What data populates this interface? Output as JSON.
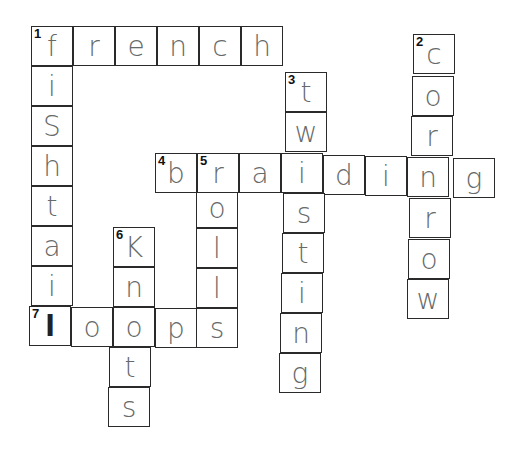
{
  "puzzle": {
    "cell_width": 42,
    "cell_height": 40,
    "cells": [
      {
        "x": 31,
        "y": 26,
        "letter": "f",
        "num": "1"
      },
      {
        "x": 73,
        "y": 26,
        "letter": "r"
      },
      {
        "x": 115,
        "y": 26,
        "letter": "e"
      },
      {
        "x": 157,
        "y": 26,
        "letter": "n"
      },
      {
        "x": 199,
        "y": 26,
        "letter": "c"
      },
      {
        "x": 241,
        "y": 26,
        "letter": "h"
      },
      {
        "x": 31,
        "y": 66,
        "letter": "i"
      },
      {
        "x": 31,
        "y": 106,
        "letter": "S"
      },
      {
        "x": 31,
        "y": 146,
        "letter": "h"
      },
      {
        "x": 31,
        "y": 186,
        "letter": "t"
      },
      {
        "x": 31,
        "y": 226,
        "letter": "a"
      },
      {
        "x": 31,
        "y": 266,
        "letter": "i"
      },
      {
        "x": 29,
        "y": 306,
        "letter": "l",
        "num": "7",
        "dark": true
      },
      {
        "x": 71,
        "y": 307,
        "letter": "o"
      },
      {
        "x": 113,
        "y": 307,
        "letter": "o"
      },
      {
        "x": 155,
        "y": 308,
        "letter": "p"
      },
      {
        "x": 196,
        "y": 308,
        "letter": "s"
      },
      {
        "x": 113,
        "y": 227,
        "letter": "K",
        "num": "6"
      },
      {
        "x": 113,
        "y": 267,
        "letter": "n"
      },
      {
        "x": 109,
        "y": 347,
        "letter": "t"
      },
      {
        "x": 108,
        "y": 387,
        "letter": "s"
      },
      {
        "x": 196,
        "y": 188,
        "letter": "o"
      },
      {
        "x": 196,
        "y": 228,
        "letter": "l"
      },
      {
        "x": 196,
        "y": 268,
        "letter": "l"
      },
      {
        "x": 155,
        "y": 153,
        "letter": "b",
        "num": "4"
      },
      {
        "x": 197,
        "y": 153,
        "letter": "r",
        "num": "5"
      },
      {
        "x": 239,
        "y": 153,
        "letter": "a"
      },
      {
        "x": 281,
        "y": 153,
        "letter": "i"
      },
      {
        "x": 323,
        "y": 155,
        "letter": "d"
      },
      {
        "x": 365,
        "y": 156,
        "letter": "i"
      },
      {
        "x": 407,
        "y": 157,
        "letter": "n"
      },
      {
        "x": 453,
        "y": 158,
        "letter": "g"
      },
      {
        "x": 285,
        "y": 72,
        "letter": "t",
        "num": "3"
      },
      {
        "x": 285,
        "y": 112,
        "letter": "w"
      },
      {
        "x": 283,
        "y": 193,
        "letter": "s"
      },
      {
        "x": 282,
        "y": 233,
        "letter": "t"
      },
      {
        "x": 281,
        "y": 273,
        "letter": "i"
      },
      {
        "x": 280,
        "y": 313,
        "letter": "n"
      },
      {
        "x": 279,
        "y": 353,
        "letter": "g"
      },
      {
        "x": 413,
        "y": 34,
        "letter": "c",
        "num": "2"
      },
      {
        "x": 412,
        "y": 76,
        "letter": "o"
      },
      {
        "x": 411,
        "y": 116,
        "letter": "r"
      },
      {
        "x": 409,
        "y": 198,
        "letter": "r"
      },
      {
        "x": 408,
        "y": 239,
        "letter": "o"
      },
      {
        "x": 407,
        "y": 279,
        "letter": "w"
      }
    ]
  },
  "words": {
    "across": [
      {
        "num": "1",
        "answer": "french"
      },
      {
        "num": "4",
        "answer": "braiding"
      },
      {
        "num": "7",
        "answer": "loops"
      }
    ],
    "down": [
      {
        "num": "1",
        "answer": "fishtail"
      },
      {
        "num": "2",
        "answer": "cornrow"
      },
      {
        "num": "3",
        "answer": "twisting"
      },
      {
        "num": "5",
        "answer": "roils"
      },
      {
        "num": "6",
        "answer": "knots"
      }
    ]
  }
}
